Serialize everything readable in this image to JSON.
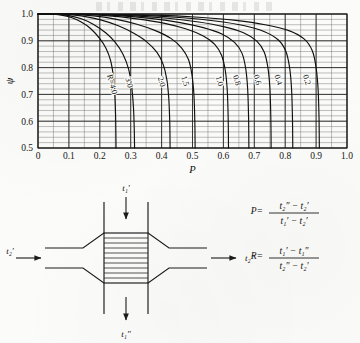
{
  "figure": {
    "kind": "lmtd-correction-factor-chart",
    "y_symbol": "ψ",
    "x_symbol": "P"
  },
  "chart_data": {
    "type": "line",
    "title": "",
    "xlabel": "P",
    "ylabel": "ψ",
    "xlim": [
      0,
      1.0
    ],
    "ylim": [
      0.5,
      1.0
    ],
    "grid": true,
    "x_ticks": [
      "0",
      "0.1",
      "0.2",
      "0.3",
      "0.4",
      "0.5",
      "0.6",
      "0.7",
      "0.8",
      "0.9",
      "1.0"
    ],
    "x_tick_values": [
      0,
      0.1,
      0.2,
      0.3,
      0.4,
      0.5,
      0.6,
      0.7,
      0.8,
      0.9,
      1.0
    ],
    "y_ticks": [
      "0.5",
      "0.6",
      "0.7",
      "0.8",
      "0.9",
      "1.0"
    ],
    "y_tick_values": [
      0.5,
      0.6,
      0.7,
      0.8,
      0.9,
      1.0
    ],
    "minor_x_step": 0.05,
    "minor_y_step": 0.02,
    "legend_position": "inline-curve-labels",
    "series": [
      {
        "name": "R=4.0",
        "label": "R=4.0",
        "R": 4.0,
        "label_at": {
          "P": 0.232,
          "psi": 0.735
        },
        "points": [
          {
            "P": 0.0,
            "psi": 1.0
          },
          {
            "P": 0.05,
            "psi": 0.999
          },
          {
            "P": 0.08,
            "psi": 0.995
          },
          {
            "P": 0.11,
            "psi": 0.986
          },
          {
            "P": 0.14,
            "psi": 0.97
          },
          {
            "P": 0.17,
            "psi": 0.946
          },
          {
            "P": 0.2,
            "psi": 0.908
          },
          {
            "P": 0.22,
            "psi": 0.872
          },
          {
            "P": 0.235,
            "psi": 0.826
          },
          {
            "P": 0.244,
            "psi": 0.766
          },
          {
            "P": 0.249,
            "psi": 0.69
          },
          {
            "P": 0.2515,
            "psi": 0.6
          },
          {
            "P": 0.2525,
            "psi": 0.5
          }
        ]
      },
      {
        "name": "3.0",
        "label": "3.0",
        "R": 3.0,
        "label_at": {
          "P": 0.287,
          "psi": 0.742
        },
        "points": [
          {
            "P": 0.0,
            "psi": 1.0
          },
          {
            "P": 0.06,
            "psi": 0.999
          },
          {
            "P": 0.1,
            "psi": 0.994
          },
          {
            "P": 0.14,
            "psi": 0.982
          },
          {
            "P": 0.18,
            "psi": 0.961
          },
          {
            "P": 0.22,
            "psi": 0.929
          },
          {
            "P": 0.25,
            "psi": 0.894
          },
          {
            "P": 0.275,
            "psi": 0.85
          },
          {
            "P": 0.293,
            "psi": 0.795
          },
          {
            "P": 0.303,
            "psi": 0.73
          },
          {
            "P": 0.309,
            "psi": 0.65
          },
          {
            "P": 0.3115,
            "psi": 0.57
          },
          {
            "P": 0.3125,
            "psi": 0.5
          }
        ]
      },
      {
        "name": "2.0",
        "label": "2.0",
        "R": 2.0,
        "label_at": {
          "P": 0.392,
          "psi": 0.745
        },
        "points": [
          {
            "P": 0.0,
            "psi": 1.0
          },
          {
            "P": 0.08,
            "psi": 0.999
          },
          {
            "P": 0.14,
            "psi": 0.993
          },
          {
            "P": 0.2,
            "psi": 0.979
          },
          {
            "P": 0.26,
            "psi": 0.956
          },
          {
            "P": 0.31,
            "psi": 0.928
          },
          {
            "P": 0.35,
            "psi": 0.898
          },
          {
            "P": 0.385,
            "psi": 0.857
          },
          {
            "P": 0.405,
            "psi": 0.812
          },
          {
            "P": 0.417,
            "psi": 0.755
          },
          {
            "P": 0.4235,
            "psi": 0.68
          },
          {
            "P": 0.4265,
            "psi": 0.59
          },
          {
            "P": 0.4275,
            "psi": 0.5
          }
        ]
      },
      {
        "name": "1.5",
        "label": "1.5",
        "R": 1.5,
        "label_at": {
          "P": 0.468,
          "psi": 0.748
        },
        "points": [
          {
            "P": 0.0,
            "psi": 1.0
          },
          {
            "P": 0.1,
            "psi": 0.999
          },
          {
            "P": 0.18,
            "psi": 0.993
          },
          {
            "P": 0.25,
            "psi": 0.981
          },
          {
            "P": 0.32,
            "psi": 0.962
          },
          {
            "P": 0.38,
            "psi": 0.938
          },
          {
            "P": 0.43,
            "psi": 0.909
          },
          {
            "P": 0.465,
            "psi": 0.873
          },
          {
            "P": 0.487,
            "psi": 0.83
          },
          {
            "P": 0.498,
            "psi": 0.775
          },
          {
            "P": 0.5045,
            "psi": 0.7
          },
          {
            "P": 0.5075,
            "psi": 0.6
          },
          {
            "P": 0.5085,
            "psi": 0.5
          }
        ]
      },
      {
        "name": "1.0",
        "label": "1.0",
        "R": 1.0,
        "label_at": {
          "P": 0.58,
          "psi": 0.748
        },
        "points": [
          {
            "P": 0.0,
            "psi": 1.0
          },
          {
            "P": 0.12,
            "psi": 0.999
          },
          {
            "P": 0.22,
            "psi": 0.994
          },
          {
            "P": 0.32,
            "psi": 0.982
          },
          {
            "P": 0.41,
            "psi": 0.965
          },
          {
            "P": 0.48,
            "psi": 0.944
          },
          {
            "P": 0.535,
            "psi": 0.918
          },
          {
            "P": 0.572,
            "psi": 0.887
          },
          {
            "P": 0.594,
            "psi": 0.846
          },
          {
            "P": 0.606,
            "psi": 0.79
          },
          {
            "P": 0.6125,
            "psi": 0.715
          },
          {
            "P": 0.6155,
            "psi": 0.61
          },
          {
            "P": 0.6165,
            "psi": 0.5
          }
        ]
      },
      {
        "name": "0.8",
        "label": "0.8",
        "R": 0.8,
        "label_at": {
          "P": 0.636,
          "psi": 0.75
        },
        "points": [
          {
            "P": 0.0,
            "psi": 1.0
          },
          {
            "P": 0.14,
            "psi": 0.999
          },
          {
            "P": 0.26,
            "psi": 0.994
          },
          {
            "P": 0.37,
            "psi": 0.983
          },
          {
            "P": 0.46,
            "psi": 0.968
          },
          {
            "P": 0.535,
            "psi": 0.949
          },
          {
            "P": 0.595,
            "psi": 0.925
          },
          {
            "P": 0.636,
            "psi": 0.894
          },
          {
            "P": 0.66,
            "psi": 0.854
          },
          {
            "P": 0.672,
            "psi": 0.798
          },
          {
            "P": 0.6785,
            "psi": 0.72
          },
          {
            "P": 0.6815,
            "psi": 0.612
          },
          {
            "P": 0.6825,
            "psi": 0.5
          }
        ]
      },
      {
        "name": "0.6",
        "label": "0.6",
        "R": 0.6,
        "label_at": {
          "P": 0.702,
          "psi": 0.752
        },
        "points": [
          {
            "P": 0.0,
            "psi": 1.0
          },
          {
            "P": 0.16,
            "psi": 0.999
          },
          {
            "P": 0.3,
            "psi": 0.994
          },
          {
            "P": 0.42,
            "psi": 0.984
          },
          {
            "P": 0.52,
            "psi": 0.97
          },
          {
            "P": 0.6,
            "psi": 0.953
          },
          {
            "P": 0.665,
            "psi": 0.93
          },
          {
            "P": 0.708,
            "psi": 0.899
          },
          {
            "P": 0.732,
            "psi": 0.858
          },
          {
            "P": 0.744,
            "psi": 0.8
          },
          {
            "P": 0.7505,
            "psi": 0.722
          },
          {
            "P": 0.7535,
            "psi": 0.613
          },
          {
            "P": 0.7545,
            "psi": 0.5
          }
        ]
      },
      {
        "name": "0.4",
        "label": "0.4",
        "R": 0.4,
        "label_at": {
          "P": 0.77,
          "psi": 0.752
        },
        "points": [
          {
            "P": 0.0,
            "psi": 1.0
          },
          {
            "P": 0.18,
            "psi": 0.999
          },
          {
            "P": 0.34,
            "psi": 0.995
          },
          {
            "P": 0.47,
            "psi": 0.986
          },
          {
            "P": 0.58,
            "psi": 0.973
          },
          {
            "P": 0.665,
            "psi": 0.957
          },
          {
            "P": 0.733,
            "psi": 0.934
          },
          {
            "P": 0.778,
            "psi": 0.903
          },
          {
            "P": 0.802,
            "psi": 0.861
          },
          {
            "P": 0.814,
            "psi": 0.802
          },
          {
            "P": 0.8205,
            "psi": 0.722
          },
          {
            "P": 0.8235,
            "psi": 0.612
          },
          {
            "P": 0.8245,
            "psi": 0.5
          }
        ]
      },
      {
        "name": "0.2",
        "label": "0.2",
        "R": 0.2,
        "label_at": {
          "P": 0.862,
          "psi": 0.752
        },
        "points": [
          {
            "P": 0.0,
            "psi": 1.0
          },
          {
            "P": 0.2,
            "psi": 0.999
          },
          {
            "P": 0.38,
            "psi": 0.996
          },
          {
            "P": 0.52,
            "psi": 0.988
          },
          {
            "P": 0.64,
            "psi": 0.976
          },
          {
            "P": 0.735,
            "psi": 0.96
          },
          {
            "P": 0.812,
            "psi": 0.938
          },
          {
            "P": 0.862,
            "psi": 0.906
          },
          {
            "P": 0.888,
            "psi": 0.862
          },
          {
            "P": 0.9,
            "psi": 0.8
          },
          {
            "P": 0.9065,
            "psi": 0.718
          },
          {
            "P": 0.9095,
            "psi": 0.61
          },
          {
            "P": 0.9105,
            "psi": 0.5
          }
        ]
      }
    ]
  },
  "diagram": {
    "name": "crossflow-heat-exchanger",
    "streams": {
      "top_inlet": "t₁′",
      "bottom_outlet": "t₁″",
      "left_inlet": "t₂′",
      "right_outlet": "t₂″"
    }
  },
  "equations": {
    "p": {
      "lhs": "P=",
      "numerator": "t₂″ − t₂′",
      "denominator": "t₁′ − t₂′"
    },
    "r": {
      "lhs": "R=",
      "numerator": "t₁′ − t₁″",
      "denominator": "t₂″ − t₂′"
    }
  }
}
